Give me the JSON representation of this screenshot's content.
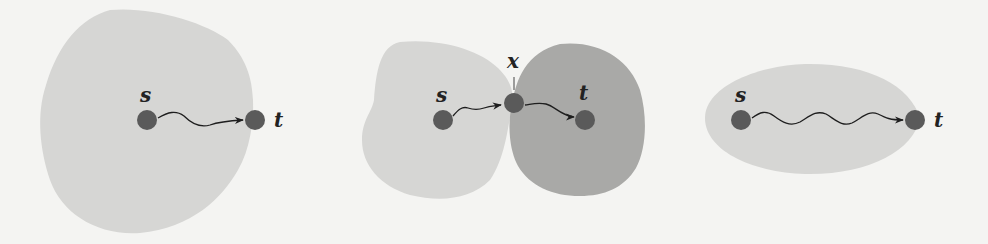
{
  "colors": {
    "background": "#f4f4f2",
    "region_light": "#d6d6d4",
    "region_dark": "#a9a9a7",
    "node": "#5a5a5a",
    "path": "#1e1e1e"
  },
  "panels": [
    {
      "id": "panel-1",
      "description": "single region containing s, t on boundary",
      "nodes": [
        {
          "label": "s"
        },
        {
          "label": "t"
        }
      ],
      "edge": {
        "from": "s",
        "to": "t",
        "style": "wavy-arrow"
      }
    },
    {
      "id": "panel-2",
      "description": "two regions touching at cut vertex x",
      "nodes": [
        {
          "label": "s"
        },
        {
          "label": "x"
        },
        {
          "label": "t"
        }
      ],
      "edges": [
        {
          "from": "s",
          "to": "x",
          "style": "wavy-arrow"
        },
        {
          "from": "x",
          "to": "t",
          "style": "wavy-arrow"
        }
      ]
    },
    {
      "id": "panel-3",
      "description": "elliptical region containing s, t on boundary",
      "nodes": [
        {
          "label": "s"
        },
        {
          "label": "t"
        }
      ],
      "edge": {
        "from": "s",
        "to": "t",
        "style": "wavy-arrow"
      }
    }
  ]
}
